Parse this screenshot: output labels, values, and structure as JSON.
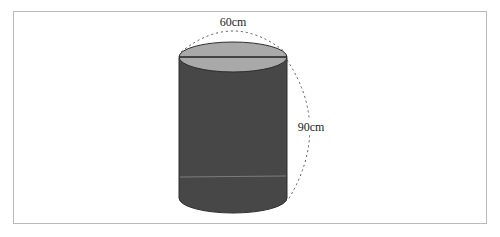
{
  "figure": {
    "shape": "cylinder",
    "diameter_label": "60cm",
    "height_label": "90cm",
    "colors": {
      "top_face": "#a9a9a9",
      "body": "#474747",
      "outline": "#2a2a2a",
      "dashed": "#555555",
      "frame": "#b9b9b9"
    }
  }
}
